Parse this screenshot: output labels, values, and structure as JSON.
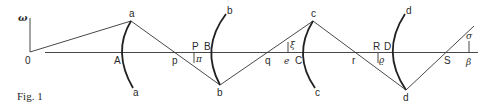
{
  "figure": {
    "caption": "Fig. 1",
    "axis_label": "ω",
    "origin_label": "0"
  },
  "points": {
    "a_top": "a",
    "a_bottom": "a",
    "b_top": "b",
    "b_bottom": "b",
    "c_top": "c",
    "c_bottom": "c",
    "d_top": "d",
    "d_bottom": "d",
    "A": "A",
    "B": "B",
    "C": "C",
    "D": "D",
    "p": "p",
    "q": "q",
    "r": "r",
    "S": "S",
    "P": "P",
    "R": "R"
  },
  "greek": {
    "pi": "π",
    "xi": "ξ",
    "e": "e",
    "rho": "ϱ",
    "sigma": "σ",
    "beta": "β"
  },
  "colors": {
    "line": "#333333",
    "background": "#ffffff"
  }
}
